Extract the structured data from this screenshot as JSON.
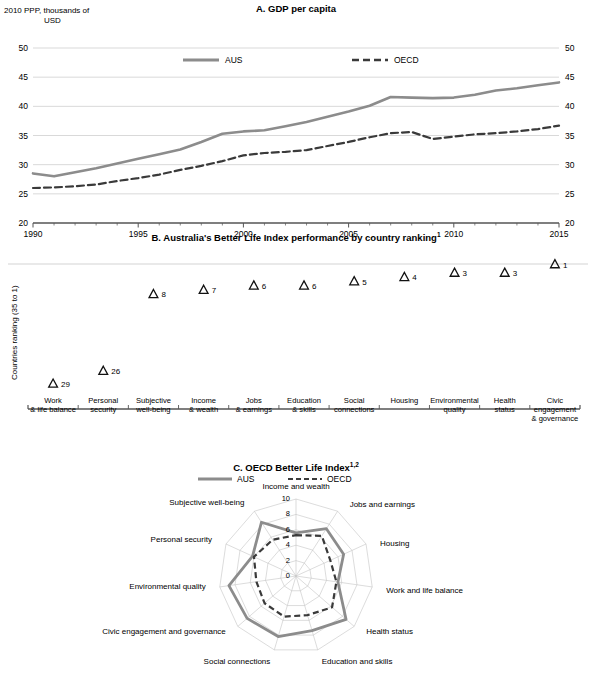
{
  "figure": {
    "panelA": {
      "title": "A. GDP per capita",
      "unit_label_line1": "2010 PPP, thousands of",
      "unit_label_line2": "USD",
      "legend": [
        {
          "name": "AUS",
          "style": "solid",
          "color": "#8c8c8c"
        },
        {
          "name": "OECD",
          "style": "dashed",
          "color": "#3a3a3a"
        }
      ],
      "yticks": [
        "50",
        "45",
        "40",
        "35",
        "30",
        "25",
        "20"
      ],
      "xticks": [
        "1990",
        "1995",
        "2000",
        "2005",
        "2010",
        "2015"
      ]
    },
    "panelB": {
      "title": "B. Australia's Better Life Index performance by country ranking",
      "title_sup": "1",
      "ylabel": "Countries ranking (35 to 1)",
      "marker": "triangle-up"
    },
    "panelC": {
      "title": "C. OECD Better Life Index",
      "title_sup": "1,2",
      "legend": [
        {
          "name": "AUS",
          "style": "solid",
          "color": "#8c8c8c"
        },
        {
          "name": "OECD",
          "style": "dashed",
          "color": "#3a3a3a"
        }
      ],
      "rticks": [
        "10",
        "8",
        "6",
        "4",
        "2",
        "0"
      ]
    }
  },
  "chart_data": [
    {
      "type": "line",
      "panel": "A",
      "title": "A. GDP per capita",
      "xlabel": "",
      "ylabel": "2010 PPP, thousands of USD",
      "xlim": [
        1990,
        2015
      ],
      "ylim": [
        20,
        50
      ],
      "yticks": [
        20,
        25,
        30,
        35,
        40,
        45,
        50
      ],
      "xticks": [
        1990,
        1995,
        2000,
        2005,
        2010,
        2015
      ],
      "grid": true,
      "legend_position": "top-center",
      "x": [
        1990,
        1991,
        1992,
        1993,
        1994,
        1995,
        1996,
        1997,
        1998,
        1999,
        2000,
        2001,
        2002,
        2003,
        2004,
        2005,
        2006,
        2007,
        2008,
        2009,
        2010,
        2011,
        2012,
        2013,
        2014,
        2015
      ],
      "series": [
        {
          "name": "AUS",
          "style": "solid",
          "color": "#8c8c8c",
          "values": [
            28.5,
            28.0,
            28.7,
            29.4,
            30.2,
            31.0,
            31.8,
            32.6,
            33.9,
            35.3,
            35.7,
            35.9,
            36.6,
            37.3,
            38.2,
            39.1,
            40.1,
            41.6,
            41.5,
            41.4,
            41.5,
            42.0,
            42.7,
            43.1,
            43.6,
            44.1
          ]
        },
        {
          "name": "OECD",
          "style": "dashed",
          "color": "#3a3a3a",
          "values": [
            26.0,
            26.1,
            26.3,
            26.6,
            27.2,
            27.7,
            28.3,
            29.1,
            29.8,
            30.6,
            31.6,
            32.0,
            32.2,
            32.5,
            33.2,
            33.9,
            34.7,
            35.4,
            35.6,
            34.4,
            34.8,
            35.2,
            35.4,
            35.7,
            36.1,
            36.7
          ]
        }
      ]
    },
    {
      "type": "scatter",
      "panel": "B",
      "title": "B. Australia's Better Life Index performance by country ranking",
      "xlabel": "",
      "ylabel": "Countries ranking (35 to 1)",
      "ylim": [
        35,
        1
      ],
      "grid": false,
      "marker": "triangle-up",
      "categories": [
        "Work & life balance",
        "Personal security",
        "Subjective well-being",
        "Income & wealth",
        "Jobs & earnings",
        "Education & skills",
        "Social connections",
        "Housing",
        "Environmental quality",
        "Health status",
        "Civic engagement & governance"
      ],
      "category_lines": [
        [
          "Work",
          "& life balance"
        ],
        [
          "Personal",
          "security"
        ],
        [
          "Subjective",
          "well-being"
        ],
        [
          "Income",
          "& wealth"
        ],
        [
          "Jobs",
          "& earnings"
        ],
        [
          "Education",
          "& skills"
        ],
        [
          "Social",
          "connections"
        ],
        [
          "Housing",
          ""
        ],
        [
          "Environmental",
          "quality"
        ],
        [
          "Health",
          "status"
        ],
        [
          "Civic engagement",
          "& governance"
        ]
      ],
      "values": [
        29,
        26,
        8,
        7,
        6,
        6,
        5,
        4,
        3,
        3,
        1
      ],
      "data_labels": [
        "29",
        "26",
        "8",
        "7",
        "6",
        "6",
        "5",
        "4",
        "3",
        "3",
        "1"
      ]
    },
    {
      "type": "radar",
      "panel": "C",
      "title": "C. OECD Better Life Index",
      "rlim": [
        0,
        10
      ],
      "rticks": [
        0,
        2,
        4,
        6,
        8,
        10
      ],
      "grid": true,
      "legend_position": "top-center",
      "categories": [
        "Income and wealth",
        "Jobs and earnings",
        "Housing",
        "Work and life balance",
        "Health status",
        "Education and skills",
        "Social connections",
        "Civic engagement and governance",
        "Environmental quality",
        "Personal security",
        "Subjective well-being"
      ],
      "series": [
        {
          "name": "AUS",
          "style": "solid",
          "color": "#8c8c8c",
          "values": [
            5.6,
            7.3,
            6.8,
            5.5,
            8.6,
            7.4,
            8.2,
            8.4,
            8.8,
            6.2,
            8.3
          ]
        },
        {
          "name": "OECD",
          "style": "dashed",
          "color": "#3a3a3a",
          "values": [
            5.3,
            6.2,
            4.9,
            5.3,
            6.2,
            5.3,
            5.5,
            5.4,
            5.2,
            6.0,
            5.6
          ]
        }
      ]
    }
  ]
}
